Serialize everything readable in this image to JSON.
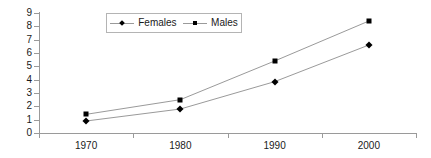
{
  "chart_data": {
    "type": "line",
    "title": "",
    "xlabel": "",
    "ylabel": "",
    "categories": [
      "1970",
      "1980",
      "1990",
      "2000"
    ],
    "ylim": [
      0,
      9
    ],
    "y_ticks": [
      "0",
      "1",
      "2",
      "3",
      "4",
      "5",
      "6",
      "7",
      "8",
      "9"
    ],
    "grid": false,
    "legend_position": "top-center",
    "series": [
      {
        "name": "Females",
        "marker": "diamond",
        "color": "#000000",
        "line_color": "#9a9a9a",
        "values": [
          0.9,
          1.8,
          3.85,
          6.6
        ]
      },
      {
        "name": "Males",
        "marker": "square",
        "color": "#000000",
        "line_color": "#9a9a9a",
        "values": [
          1.4,
          2.5,
          5.4,
          8.4
        ]
      }
    ]
  },
  "legend": {
    "items": [
      {
        "label": "Females",
        "marker": "diamond-marker-icon"
      },
      {
        "label": "Males",
        "marker": "square-marker-icon"
      }
    ]
  },
  "axes": {
    "y_tick_labels": [
      "9",
      "8",
      "7",
      "6",
      "5",
      "4",
      "3",
      "2",
      "1",
      "0"
    ],
    "x_tick_labels": [
      "1970",
      "1980",
      "1990",
      "2000"
    ]
  }
}
